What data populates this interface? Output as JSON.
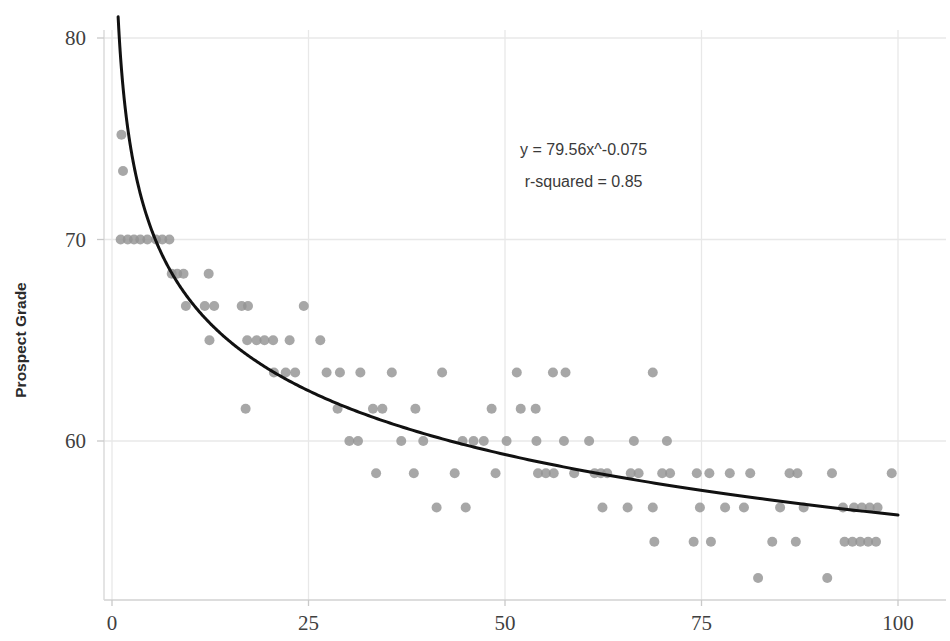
{
  "chart_data": {
    "type": "scatter",
    "title": "",
    "xlabel": "",
    "ylabel": "Prospect Grade",
    "xlim": [
      0,
      100
    ],
    "ylim": [
      52.0,
      80.5
    ],
    "xticks": [
      0,
      25,
      50,
      75,
      100
    ],
    "yticks": [
      60,
      70,
      80
    ],
    "xtick_labels": [
      "0",
      "25",
      "50",
      "75",
      "100"
    ],
    "ytick_labels": [
      "60",
      "70",
      "80"
    ],
    "grid": true,
    "grid_color": "#e8e8e8",
    "legend": "none",
    "marker_color": "#949494",
    "marker_size": 5.0,
    "marker_shape": "circle",
    "annotations": [
      {
        "text": "y = 79.56x^-0.075",
        "x": 60.0,
        "y": 74.2
      },
      {
        "text": "r-squared =  0.85",
        "x": 60.0,
        "y": 72.6
      }
    ],
    "fit": {
      "type": "power",
      "equation": "y = 79.56x^-0.075",
      "coefficient": 79.56,
      "exponent": -0.075,
      "r_squared": 0.85,
      "line_color": "#111111",
      "line_width": 3.0,
      "x_start": 0.78,
      "x_end": 100.0
    },
    "points": [
      [
        1.2,
        75.2
      ],
      [
        1.4,
        73.4
      ],
      [
        1.1,
        70.0
      ],
      [
        2.0,
        70.0
      ],
      [
        2.8,
        70.0
      ],
      [
        3.6,
        70.0
      ],
      [
        4.5,
        70.0
      ],
      [
        5.6,
        70.0
      ],
      [
        6.4,
        70.0
      ],
      [
        7.3,
        70.0
      ],
      [
        7.6,
        68.3
      ],
      [
        8.3,
        68.3
      ],
      [
        9.1,
        68.3
      ],
      [
        12.3,
        68.3
      ],
      [
        9.4,
        66.7
      ],
      [
        11.8,
        66.7
      ],
      [
        13.0,
        66.7
      ],
      [
        16.5,
        66.7
      ],
      [
        17.3,
        66.7
      ],
      [
        24.4,
        66.7
      ],
      [
        12.4,
        65.0
      ],
      [
        17.2,
        65.0
      ],
      [
        18.4,
        65.0
      ],
      [
        19.4,
        65.0
      ],
      [
        20.5,
        65.0
      ],
      [
        22.6,
        65.0
      ],
      [
        26.5,
        65.0
      ],
      [
        20.6,
        63.4
      ],
      [
        22.1,
        63.4
      ],
      [
        23.3,
        63.4
      ],
      [
        27.3,
        63.4
      ],
      [
        29.0,
        63.4
      ],
      [
        31.6,
        63.4
      ],
      [
        35.6,
        63.4
      ],
      [
        42.0,
        63.4
      ],
      [
        51.5,
        63.4
      ],
      [
        56.1,
        63.4
      ],
      [
        57.7,
        63.4
      ],
      [
        68.8,
        63.4
      ],
      [
        17.0,
        61.6
      ],
      [
        28.7,
        61.6
      ],
      [
        33.2,
        61.6
      ],
      [
        34.4,
        61.6
      ],
      [
        38.6,
        61.6
      ],
      [
        48.3,
        61.6
      ],
      [
        52.0,
        61.6
      ],
      [
        53.9,
        61.6
      ],
      [
        30.2,
        60.0
      ],
      [
        31.3,
        60.0
      ],
      [
        36.8,
        60.0
      ],
      [
        39.6,
        60.0
      ],
      [
        44.6,
        60.0
      ],
      [
        46.0,
        60.0
      ],
      [
        47.3,
        60.0
      ],
      [
        50.2,
        60.0
      ],
      [
        54.0,
        60.0
      ],
      [
        57.5,
        60.0
      ],
      [
        60.7,
        60.0
      ],
      [
        66.4,
        60.0
      ],
      [
        70.6,
        60.0
      ],
      [
        33.6,
        58.4
      ],
      [
        38.4,
        58.4
      ],
      [
        43.6,
        58.4
      ],
      [
        48.8,
        58.4
      ],
      [
        54.2,
        58.4
      ],
      [
        55.2,
        58.4
      ],
      [
        56.2,
        58.4
      ],
      [
        58.8,
        58.4
      ],
      [
        61.4,
        58.4
      ],
      [
        62.2,
        58.4
      ],
      [
        63.0,
        58.4
      ],
      [
        66.0,
        58.4
      ],
      [
        67.0,
        58.4
      ],
      [
        70.0,
        58.4
      ],
      [
        71.0,
        58.4
      ],
      [
        74.4,
        58.4
      ],
      [
        76.0,
        58.4
      ],
      [
        78.6,
        58.4
      ],
      [
        81.2,
        58.4
      ],
      [
        86.2,
        58.4
      ],
      [
        87.2,
        58.4
      ],
      [
        91.6,
        58.4
      ],
      [
        99.2,
        58.4
      ],
      [
        41.3,
        56.7
      ],
      [
        45.0,
        56.7
      ],
      [
        62.4,
        56.7
      ],
      [
        65.6,
        56.7
      ],
      [
        68.8,
        56.7
      ],
      [
        74.8,
        56.7
      ],
      [
        78.0,
        56.7
      ],
      [
        80.4,
        56.7
      ],
      [
        85.0,
        56.7
      ],
      [
        88.0,
        56.7
      ],
      [
        93.0,
        56.7
      ],
      [
        94.4,
        56.7
      ],
      [
        95.4,
        56.7
      ],
      [
        96.4,
        56.7
      ],
      [
        97.4,
        56.7
      ],
      [
        69.0,
        55.0
      ],
      [
        74.0,
        55.0
      ],
      [
        76.2,
        55.0
      ],
      [
        84.0,
        55.0
      ],
      [
        87.0,
        55.0
      ],
      [
        93.2,
        55.0
      ],
      [
        94.2,
        55.0
      ],
      [
        95.2,
        55.0
      ],
      [
        96.2,
        55.0
      ],
      [
        97.2,
        55.0
      ],
      [
        82.2,
        53.2
      ],
      [
        91.0,
        53.2
      ]
    ]
  }
}
